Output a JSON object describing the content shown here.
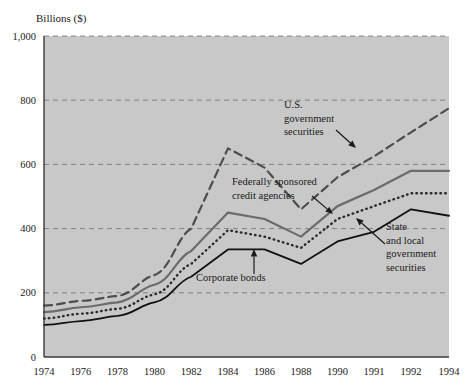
{
  "figure": {
    "y_axis_title": "Billions ($)",
    "background_color": "#c8c8c8",
    "page_color": "#ffffff"
  },
  "chart_data": {
    "type": "line",
    "title": "",
    "subtitle": "",
    "xlabel": "",
    "ylabel": "Billions ($)",
    "ylim": [
      0,
      1000
    ],
    "yticks": [
      0,
      200,
      400,
      600,
      800,
      1000
    ],
    "ytick_labels": [
      "0",
      "200",
      "400",
      "600",
      "800",
      "1,000"
    ],
    "grid": true,
    "grid_axis": "y",
    "legend_position": "inline-annotations",
    "x": [
      1974,
      1976,
      1978,
      1980,
      1982,
      1984,
      1986,
      1988,
      1990,
      1991,
      1992,
      1994
    ],
    "xtick_labels": [
      "1974",
      "1976",
      "1978",
      "1980",
      "1982",
      "1984",
      "1986",
      "1988",
      "1990",
      "1991",
      "1992",
      "1994"
    ],
    "series": [
      {
        "name": "U.S. government securities",
        "style": "dashed",
        "color": "#4d4d4d",
        "width": 2.2,
        "values": [
          160,
          175,
          190,
          255,
          400,
          650,
          590,
          460,
          560,
          625,
          700,
          775
        ]
      },
      {
        "name": "Federally sponsored credit agencies",
        "style": "solid-gray",
        "color": "#6b6b6b",
        "width": 2.2,
        "values": [
          140,
          155,
          170,
          225,
          330,
          450,
          430,
          375,
          470,
          520,
          580,
          580
        ]
      },
      {
        "name": "State and local government securities",
        "style": "dotted",
        "color": "#2b2b2b",
        "width": 2.4,
        "values": [
          120,
          135,
          150,
          195,
          290,
          395,
          375,
          340,
          430,
          470,
          510,
          510
        ]
      },
      {
        "name": "Corporate bonds",
        "style": "solid-black",
        "color": "#111111",
        "width": 1.8,
        "values": [
          100,
          112,
          128,
          170,
          250,
          335,
          335,
          290,
          360,
          390,
          460,
          440
        ]
      }
    ],
    "annotations": [
      {
        "id": "us-gov-securities",
        "lines": [
          "U.S.",
          "government",
          "securities"
        ],
        "text_x": 284,
        "text_y": 108,
        "arrow_from_x": 336,
        "arrow_from_y": 130,
        "arrow_to_x": 356,
        "arrow_to_y": 148
      },
      {
        "id": "federally-sponsored",
        "lines": [
          "Federally sponsored",
          "credit agencies"
        ],
        "text_x": 232,
        "text_y": 185,
        "arrow_from_x": 312,
        "arrow_from_y": 196,
        "arrow_to_x": 333,
        "arrow_to_y": 214
      },
      {
        "id": "state-local",
        "lines": [
          "State",
          "and local",
          "government",
          "securities"
        ],
        "text_x": 386,
        "text_y": 230,
        "arrow_from_x": 385,
        "arrow_from_y": 244,
        "arrow_to_x": 356,
        "arrow_to_y": 218
      },
      {
        "id": "corporate-bonds",
        "lines": [
          "Corporate bonds"
        ],
        "text_x": 196,
        "text_y": 281,
        "arrow_from_x": 254,
        "arrow_from_y": 274,
        "arrow_to_x": 254,
        "arrow_to_y": 249
      }
    ]
  }
}
